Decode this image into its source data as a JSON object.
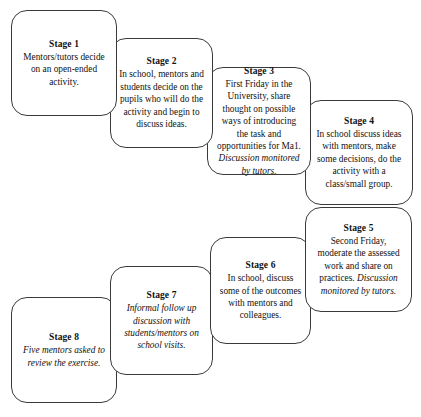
{
  "diagram": {
    "type": "cascading-flowchart",
    "title": "",
    "background_color": "#ffffff",
    "box_border_color": "#3a3a3a",
    "box_fill_color": "#ffffff",
    "text_color": "#111111",
    "stages": [
      {
        "id": "stage-1",
        "title": "Stage 1",
        "body": "Mentors/tutors decide on an open-ended activity.",
        "body_italic_tail": "",
        "all_italic": false
      },
      {
        "id": "stage-2",
        "title": "Stage 2",
        "body": "In school, mentors and students decide on the pupils who will do the activity and begin to discuss ideas.",
        "body_italic_tail": "",
        "all_italic": false
      },
      {
        "id": "stage-3",
        "title": "Stage 3",
        "body": "First Friday in the University, share thought on possible ways of introducing the task and opportunities for Ma1. ",
        "body_italic_tail": "Discussion monitored by tutors.",
        "all_italic": false
      },
      {
        "id": "stage-4",
        "title": "Stage 4",
        "body": "In school discuss ideas with mentors, make some decisions, do the activity with a class/small group.",
        "body_italic_tail": "",
        "all_italic": false
      },
      {
        "id": "stage-5",
        "title": "Stage 5",
        "body": "Second Friday, moderate the assessed work and share on practices. ",
        "body_italic_tail": "Discussion monitored by tutors.",
        "all_italic": false
      },
      {
        "id": "stage-6",
        "title": "Stage 6",
        "body": "In  school, discuss some of the outcomes with mentors and colleagues.",
        "body_italic_tail": "",
        "all_italic": false
      },
      {
        "id": "stage-7",
        "title": "Stage 7",
        "body": "Informal follow up discussion with students/mentors on school visits.",
        "body_italic_tail": "",
        "all_italic": true
      },
      {
        "id": "stage-8",
        "title": "Stage 8",
        "body": "Five mentors asked to review the exercise.",
        "body_italic_tail": "",
        "all_italic": true
      }
    ]
  }
}
